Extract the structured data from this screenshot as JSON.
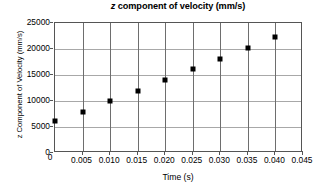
{
  "chart_data": {
    "type": "scatter",
    "title": "z component of velocity (mm/s)",
    "title_italic_prefix": "z",
    "title_rest": " component of velocity (mm/s)",
    "xlabel": "Time (s)",
    "ylabel": "z Component of Velocity (mm/s)",
    "xlim": [
      0,
      0.045
    ],
    "ylim": [
      0,
      25000
    ],
    "grid": true,
    "legend": "none",
    "marker": "square",
    "marker_color": "#000000",
    "x": [
      0.0,
      0.005,
      0.01,
      0.015,
      0.02,
      0.025,
      0.03,
      0.035,
      0.04
    ],
    "values": [
      6200,
      7900,
      10000,
      11900,
      14100,
      16100,
      18100,
      20100,
      22300
    ],
    "xticks": [
      0,
      0.005,
      0.01,
      0.015,
      0.02,
      0.025,
      0.03,
      0.035,
      0.04,
      0.045
    ],
    "xtick_labels": [
      "0",
      "0.005",
      "0.010",
      "0.015",
      "0.020",
      "0.025",
      "0.030",
      "0.035",
      "0.040",
      "0.045"
    ],
    "yticks": [
      0,
      5000,
      10000,
      15000,
      20000,
      25000
    ],
    "ytick_labels": [
      "0",
      "5000",
      "10000",
      "15000",
      "20000",
      "25000"
    ]
  }
}
